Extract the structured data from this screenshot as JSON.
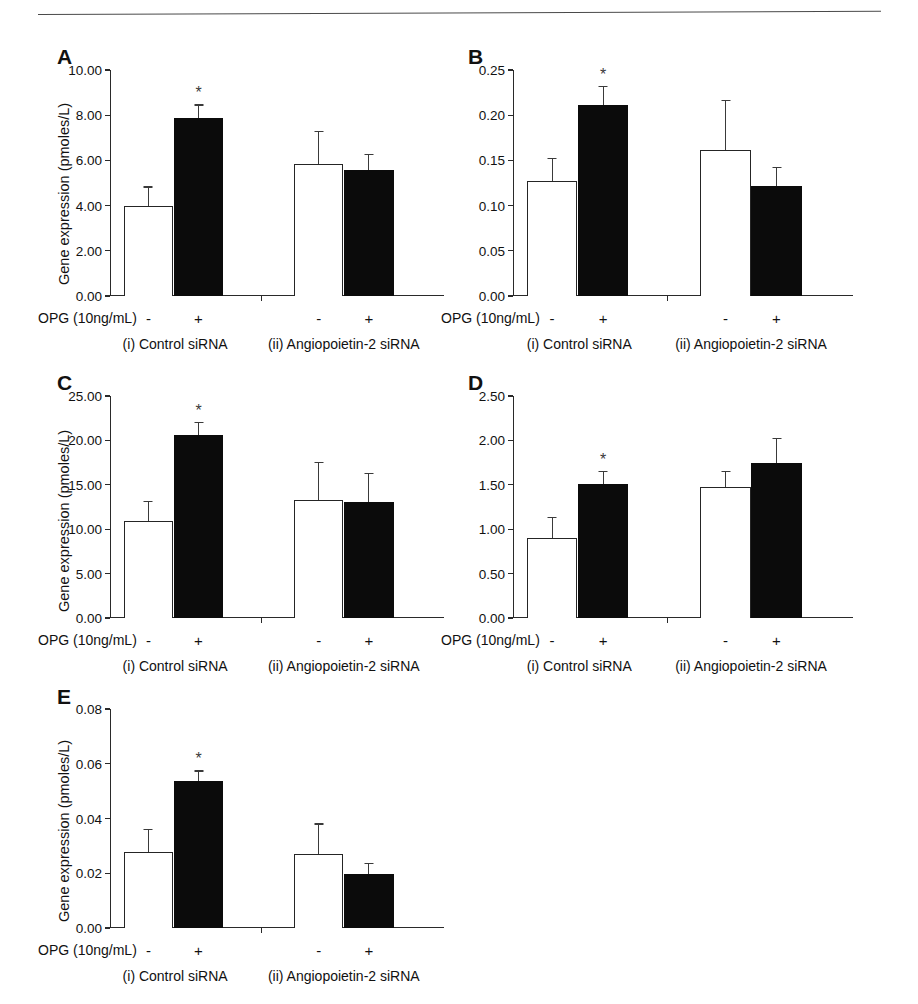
{
  "figure": {
    "panel_letters": [
      "A",
      "B",
      "C",
      "D",
      "E"
    ],
    "axis_title": "Gene expression (pmoles/L)",
    "treatment_label": "OPG (10ng/mL)",
    "minus_sign": "-",
    "plus_sign": "+",
    "group_labels": [
      "(i) Control siRNA",
      "(ii) Angiopoietin-2 siRNA"
    ],
    "significance_marker": "*",
    "colors": {
      "bar_open_fill": "#ffffff",
      "bar_open_stroke": "#252525",
      "bar_filled": "#0b0b0b",
      "axis": "#2a2a2a",
      "text": "#111111",
      "rule": "#4a4a4a"
    }
  },
  "chart_data": [
    {
      "type": "bar",
      "panel": "A",
      "title": "",
      "xlabel": "OPG (10ng/mL)",
      "ylabel": "Gene expression (pmoles/L)",
      "ylim": [
        0,
        10
      ],
      "yticks": [
        0,
        2,
        4,
        6,
        8,
        10
      ],
      "ytick_labels": [
        "0.00",
        "2.00",
        "4.00",
        "6.00",
        "8.00",
        "10.00"
      ],
      "grid": false,
      "legend": "none",
      "categories": [
        "-",
        "+",
        "-",
        "+"
      ],
      "groups": [
        "(i) Control siRNA",
        "(i) Control siRNA",
        "(ii) Angiopoietin-2 siRNA",
        "(ii) Angiopoietin-2 siRNA"
      ],
      "values": [
        3.99,
        7.86,
        5.85,
        5.56
      ],
      "errors": [
        0.86,
        0.62,
        1.45,
        0.72
      ],
      "fills": [
        "open",
        "filled",
        "open",
        "filled"
      ],
      "significant": [
        false,
        true,
        false,
        false
      ]
    },
    {
      "type": "bar",
      "panel": "B",
      "title": "",
      "xlabel": "OPG (10ng/mL)",
      "ylabel": "",
      "ylim": [
        0,
        0.25
      ],
      "yticks": [
        0,
        0.05,
        0.1,
        0.15,
        0.2,
        0.25
      ],
      "ytick_labels": [
        "0.00",
        "0.05",
        "0.10",
        "0.15",
        "0.20",
        "0.25"
      ],
      "grid": false,
      "legend": "none",
      "categories": [
        "-",
        "+",
        "-",
        "+"
      ],
      "groups": [
        "(i) Control siRNA",
        "(i) Control siRNA",
        "(ii) Angiopoietin-2 siRNA",
        "(ii) Angiopoietin-2 siRNA"
      ],
      "values": [
        0.127,
        0.211,
        0.162,
        0.122
      ],
      "errors": [
        0.026,
        0.021,
        0.055,
        0.021
      ],
      "fills": [
        "open",
        "filled",
        "open",
        "filled"
      ],
      "significant": [
        false,
        true,
        false,
        false
      ]
    },
    {
      "type": "bar",
      "panel": "C",
      "title": "",
      "xlabel": "OPG (10ng/mL)",
      "ylabel": "Gene expression (pmoles/L)",
      "ylim": [
        0,
        25
      ],
      "yticks": [
        0,
        5,
        10,
        15,
        20,
        25
      ],
      "ytick_labels": [
        "0.00",
        "5.00",
        "10.00",
        "15.00",
        "20.00",
        "25.00"
      ],
      "grid": false,
      "legend": "none",
      "categories": [
        "-",
        "+",
        "-",
        "+"
      ],
      "groups": [
        "(i) Control siRNA",
        "(i) Control siRNA",
        "(ii) Angiopoietin-2 siRNA",
        "(ii) Angiopoietin-2 siRNA"
      ],
      "values": [
        10.9,
        20.6,
        13.3,
        13.1
      ],
      "errors": [
        2.3,
        1.5,
        4.3,
        3.2
      ],
      "fills": [
        "open",
        "filled",
        "open",
        "filled"
      ],
      "significant": [
        false,
        true,
        false,
        false
      ]
    },
    {
      "type": "bar",
      "panel": "D",
      "title": "",
      "xlabel": "OPG (10ng/mL)",
      "ylabel": "",
      "ylim": [
        0,
        2.5
      ],
      "yticks": [
        0,
        0.5,
        1.0,
        1.5,
        2.0,
        2.5
      ],
      "ytick_labels": [
        "0.00",
        "0.50",
        "1.00",
        "1.50",
        "2.00",
        "2.50"
      ],
      "grid": false,
      "legend": "none",
      "categories": [
        "-",
        "+",
        "-",
        "+"
      ],
      "groups": [
        "(i) Control siRNA",
        "(i) Control siRNA",
        "(ii) Angiopoietin-2 siRNA",
        "(ii) Angiopoietin-2 siRNA"
      ],
      "values": [
        0.9,
        1.51,
        1.47,
        1.75
      ],
      "errors": [
        0.24,
        0.15,
        0.19,
        0.28
      ],
      "fills": [
        "open",
        "filled",
        "open",
        "filled"
      ],
      "significant": [
        false,
        true,
        false,
        false
      ]
    },
    {
      "type": "bar",
      "panel": "E",
      "title": "",
      "xlabel": "OPG (10ng/mL)",
      "ylabel": "Gene expression (pmoles/L)",
      "ylim": [
        0,
        0.08
      ],
      "yticks": [
        0,
        0.02,
        0.04,
        0.06,
        0.08
      ],
      "ytick_labels": [
        "0.00",
        "0.02",
        "0.04",
        "0.06",
        "0.08"
      ],
      "grid": false,
      "legend": "none",
      "categories": [
        "-",
        "+",
        "-",
        "+"
      ],
      "groups": [
        "(i) Control siRNA",
        "(i) Control siRNA",
        "(ii) Angiopoietin-2 siRNA",
        "(ii) Angiopoietin-2 siRNA"
      ],
      "values": [
        0.0278,
        0.0538,
        0.0272,
        0.0199
      ],
      "errors": [
        0.0084,
        0.0038,
        0.011,
        0.004
      ],
      "fills": [
        "open",
        "filled",
        "open",
        "filled"
      ],
      "significant": [
        false,
        true,
        false,
        false
      ]
    }
  ],
  "layout": {
    "panels": [
      {
        "letter": "A",
        "letter_x": 57,
        "letter_y": 46,
        "ytitle_x": 56,
        "ytitle_y": 285,
        "plot_x": 110,
        "plot_y": 70,
        "plot_w": 334,
        "plot_h": 226,
        "axis_x_w": 334
      },
      {
        "letter": "B",
        "letter_x": 468,
        "letter_y": 46,
        "ytitle_x": 0,
        "ytitle_y": 0,
        "plot_x": 513,
        "plot_y": 70,
        "plot_w": 340,
        "plot_h": 226,
        "axis_x_w": 340
      },
      {
        "letter": "C",
        "letter_x": 57,
        "letter_y": 372,
        "ytitle_x": 56,
        "ytitle_y": 612,
        "plot_x": 110,
        "plot_y": 396,
        "plot_w": 334,
        "plot_h": 222,
        "axis_x_w": 334
      },
      {
        "letter": "D",
        "letter_x": 468,
        "letter_y": 372,
        "ytitle_x": 0,
        "ytitle_y": 0,
        "plot_x": 513,
        "plot_y": 396,
        "plot_w": 340,
        "plot_h": 222,
        "axis_x_w": 340
      },
      {
        "letter": "E",
        "letter_x": 57,
        "letter_y": 686,
        "ytitle_x": 56,
        "ytitle_y": 922,
        "plot_x": 110,
        "plot_y": 709,
        "plot_w": 334,
        "plot_h": 219,
        "axis_x_w": 334
      }
    ],
    "bar_centers_frac": [
      0.115,
      0.265,
      0.625,
      0.775
    ],
    "bar_width_frac": 0.148,
    "mid_tick_frac": 0.452,
    "group_label_frac": [
      0.195,
      0.7
    ],
    "opg_label_offset_x": -72,
    "opg_label_offset_y": 14,
    "sign_offset_y": 14,
    "group_offset_y": 40
  }
}
